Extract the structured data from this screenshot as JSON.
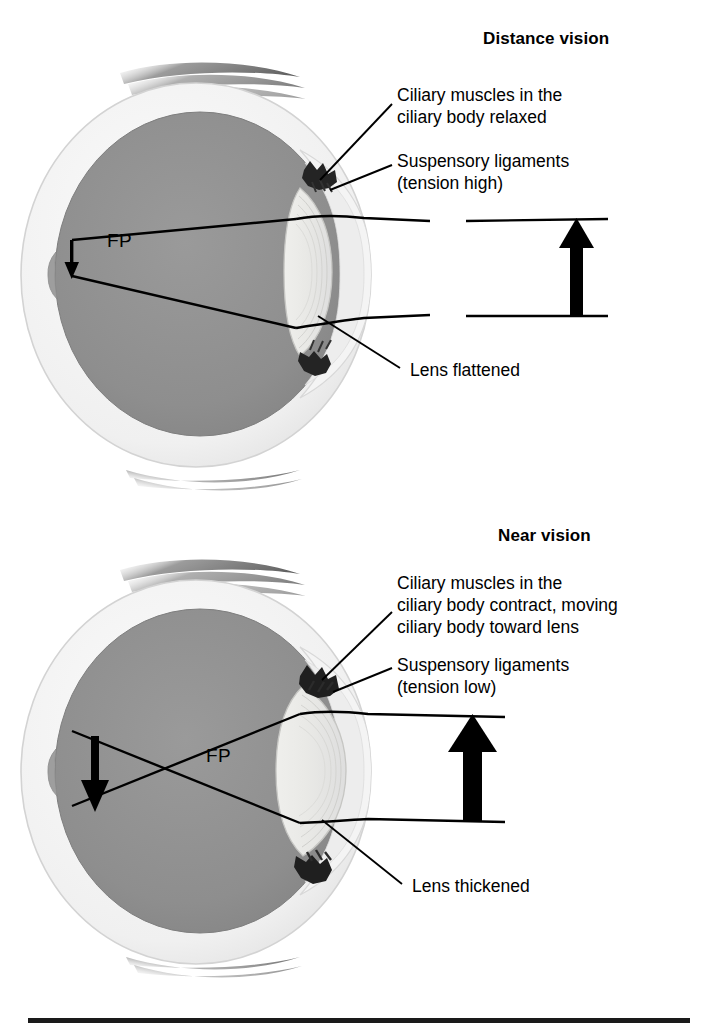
{
  "figure": {
    "background_color": "#ffffff",
    "bottom_rule_color": "#1a1a1a"
  },
  "panels": [
    {
      "id": "distance-vision",
      "title": "Distance vision",
      "focal_point_label": "FP",
      "callouts": [
        {
          "id": "ciliary-muscles",
          "lines": [
            "Ciliary muscles in the",
            "ciliary body relaxed"
          ]
        },
        {
          "id": "suspensory-ligaments",
          "lines": [
            "Suspensory ligaments",
            "(tension high)"
          ]
        },
        {
          "id": "lens-state",
          "lines": [
            "Lens flattened"
          ]
        }
      ],
      "object_arrow": {
        "direction": "up",
        "description": "distant object arrow",
        "width": 14,
        "gap_in_rays": true
      },
      "image_arrow": {
        "direction": "down",
        "description": "small inverted image on retina",
        "size": "small"
      }
    },
    {
      "id": "near-vision",
      "title": "Near vision",
      "focal_point_label": "FP",
      "callouts": [
        {
          "id": "ciliary-muscles",
          "lines": [
            "Ciliary muscles in the",
            "ciliary body contract, moving",
            "ciliary body toward lens"
          ]
        },
        {
          "id": "suspensory-ligaments",
          "lines": [
            "Suspensory ligaments",
            "(tension low)"
          ]
        },
        {
          "id": "lens-state",
          "lines": [
            "Lens thickened"
          ]
        }
      ],
      "object_arrow": {
        "direction": "up",
        "description": "near object arrow",
        "width": 20,
        "gap_in_rays": false
      },
      "image_arrow": {
        "direction": "down",
        "description": "large inverted image on retina",
        "size": "large"
      }
    }
  ],
  "colors": {
    "sclera": "#f1f1f1",
    "sclera_edge": "#cfcfcf",
    "vitreous": "#8e8e8e",
    "vitreous_edge": "#7d7d7d",
    "lens": "#e8e8e6",
    "lens_line": "#c9c9c6",
    "cornea": "#efefef",
    "ciliary_body": "#2a2a2a",
    "ray": "#000000",
    "muscle_tendon": "#9a9a9a",
    "text": "#000000"
  }
}
